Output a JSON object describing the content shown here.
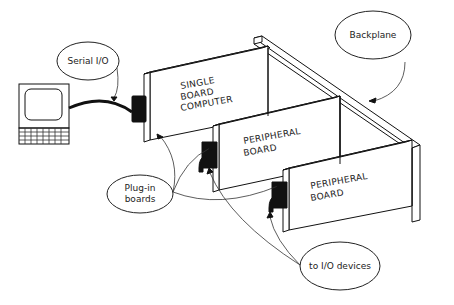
{
  "diagram": {
    "type": "bus-backplane-architecture",
    "background": "#ffffff",
    "line_color": "#111111",
    "callouts": {
      "serial_io": "Serial I/O",
      "backplane": "Backplane",
      "plugin_boards_line1": "Plug-in",
      "plugin_boards_line2": "boards",
      "io_devices": "to I/O devices"
    },
    "boards": [
      {
        "id": "sbc",
        "lines": [
          "SINGLE",
          "BOARD",
          "COMPUTER"
        ]
      },
      {
        "id": "peripheral-1",
        "lines": [
          "PERIPHERAL",
          "BOARD"
        ]
      },
      {
        "id": "peripheral-2",
        "lines": [
          "PERIPHERAL",
          "BOARD"
        ]
      }
    ],
    "components": [
      "terminal",
      "serial-cable",
      "backplane",
      "single-board-computer",
      "peripheral-board",
      "peripheral-board"
    ]
  }
}
